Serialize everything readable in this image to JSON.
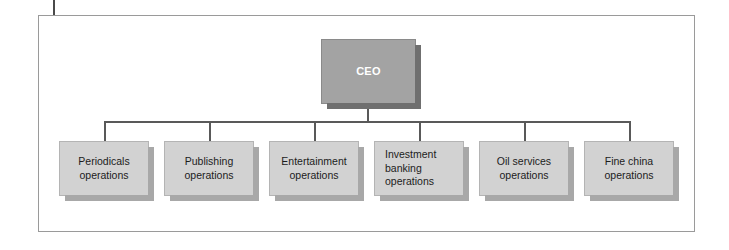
{
  "diagram": {
    "type": "organizational-chart",
    "colors": {
      "frame_border": "#9a9a9a",
      "background": "#ffffff",
      "root_fill": "#a3a3a3",
      "root_text": "#ffffff",
      "root_shadow": "#6f6f6f",
      "child_fill": "#d2d2d2",
      "child_text": "#1c1c1c",
      "child_shadow": "#a8a8a8",
      "connector": "#595959"
    },
    "root": {
      "label": "CEO"
    },
    "children": [
      {
        "label": "Periodicals\noperations",
        "line1": "Periodicals",
        "line2": "operations",
        "line3": ""
      },
      {
        "label": "Publishing\noperations",
        "line1": "Publishing",
        "line2": "operations",
        "line3": ""
      },
      {
        "label": "Entertainment\noperations",
        "line1": "Entertainment",
        "line2": "operations",
        "line3": ""
      },
      {
        "label": "Investment\nbanking\noperations",
        "line1": "Investment",
        "line2": "banking",
        "line3": "operations"
      },
      {
        "label": "Oil services\noperations",
        "line1": "Oil services",
        "line2": "operations",
        "line3": ""
      },
      {
        "label": "Fine china\noperations",
        "line1": "Fine china",
        "line2": "operations",
        "line3": ""
      }
    ]
  }
}
